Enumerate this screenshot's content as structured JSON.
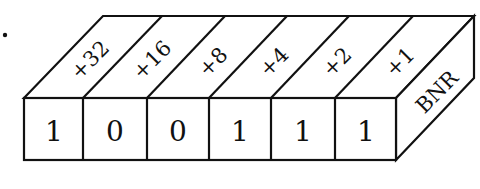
{
  "figure": {
    "marker": ".",
    "side_label": "BNR",
    "cells": [
      {
        "weight": "+32",
        "bit": "1"
      },
      {
        "weight": "+16",
        "bit": "0"
      },
      {
        "weight": "+8",
        "bit": "0"
      },
      {
        "weight": "+4",
        "bit": "1"
      },
      {
        "weight": "+2",
        "bit": "1"
      },
      {
        "weight": "+1",
        "bit": "1"
      }
    ]
  }
}
